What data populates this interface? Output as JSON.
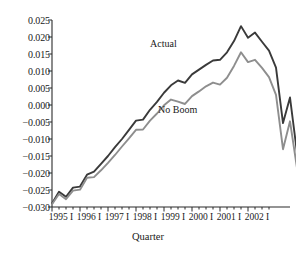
{
  "chart_data": {
    "type": "line",
    "title": "",
    "xlabel": "Quarter",
    "ylabel": "",
    "ylim": [
      -0.03,
      0.025
    ],
    "xlim": [
      0,
      31
    ],
    "grid": false,
    "legend_position": "inline-annotations",
    "ytick_labels": [
      "0.025",
      "0.020",
      "0.015",
      "0.010",
      "0.005",
      "0.000",
      "-0.005",
      "-0.010",
      "-0.015",
      "-0.020",
      "-0.025",
      "-0.030"
    ],
    "ytick_values": [
      0.025,
      0.02,
      0.015,
      0.01,
      0.005,
      0.0,
      -0.005,
      -0.01,
      -0.015,
      -0.02,
      -0.025,
      -0.03
    ],
    "xtick_labels": [
      "1995 I",
      "1996 I",
      "1997 I",
      "1998 I",
      "1999 I",
      "2000 I",
      "2001 I",
      "2002 I"
    ],
    "xtick_indices": [
      0,
      4,
      8,
      12,
      16,
      20,
      24,
      28
    ],
    "minor_tick_count": 32,
    "x": [
      "1995 I",
      "1995 II",
      "1995 III",
      "1995 IV",
      "1996 I",
      "1996 II",
      "1996 III",
      "1996 IV",
      "1997 I",
      "1997 II",
      "1997 III",
      "1997 IV",
      "1998 I",
      "1998 II",
      "1998 III",
      "1998 IV",
      "1999 I",
      "1999 II",
      "1999 III",
      "1999 IV",
      "2000 I",
      "2000 II",
      "2000 III",
      "2000 IV",
      "2001 I",
      "2001 II",
      "2001 III",
      "2001 IV",
      "2002 I",
      "2002 II",
      "2002 III",
      "2002 IV"
    ],
    "series": [
      {
        "name": "Actual",
        "color": "#3a3a3a",
        "values": [
          -0.029,
          -0.0255,
          -0.027,
          -0.0243,
          -0.024,
          -0.0205,
          -0.0196,
          -0.0173,
          -0.015,
          -0.0124,
          -0.01,
          -0.0073,
          -0.0046,
          -0.0043,
          -0.0014,
          0.0009,
          0.0036,
          0.0058,
          0.0072,
          0.0065,
          0.009,
          0.0104,
          0.0118,
          0.0131,
          0.0133,
          0.0155,
          0.0188,
          0.0232,
          0.0198,
          0.0213,
          0.0186,
          0.016
        ]
      },
      {
        "name": "No Boom",
        "color": "#8e8e8e",
        "values": [
          -0.0292,
          -0.0262,
          -0.0277,
          -0.0252,
          -0.0249,
          -0.0214,
          -0.0212,
          -0.0192,
          -0.017,
          -0.0147,
          -0.0122,
          -0.0098,
          -0.0073,
          -0.0072,
          -0.0046,
          -0.0025,
          -0.0001,
          0.0016,
          0.001,
          0.0003,
          0.0026,
          0.004,
          0.0055,
          0.0066,
          0.006,
          0.008,
          0.0115,
          0.0155,
          0.0126,
          0.0133,
          0.0109,
          0.0082
        ]
      }
    ],
    "series_extension": {
      "note": "final segment decline after 2001 I",
      "actual_tail": [
        0.016,
        0.011,
        -0.0053,
        0.0022,
        -0.014,
        -0.0192,
        -0.0202
      ],
      "noboom_tail": [
        0.0082,
        0.003,
        -0.013,
        -0.0048,
        -0.0185,
        -0.0228,
        -0.0232
      ]
    },
    "annotations": [
      {
        "text": "Actual",
        "x_frac": 0.54,
        "y_value": 0.0163
      },
      {
        "text": "No Boom",
        "x_frac": 0.6,
        "y_value": -0.0033
      }
    ]
  },
  "axis": {
    "xaxis_title": "Quarter"
  }
}
